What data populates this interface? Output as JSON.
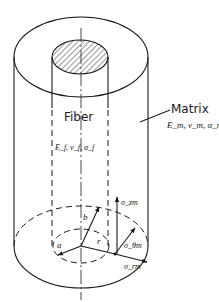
{
  "diagram": {
    "fiber": {
      "label": "Fiber",
      "properties": "E_f,   ν_f, α_f",
      "props_display": [
        "E",
        "f",
        ",",
        "ν",
        "f",
        ", α",
        "f"
      ]
    },
    "matrix": {
      "label": "Matrix",
      "properties": "E_m, ν_m, α_m"
    },
    "dimensions": {
      "inner_radius": "a",
      "outer_radius": "b",
      "radial_coordinate": "r"
    },
    "stresses": {
      "axial": "σ_zm",
      "hoop": "σ_θm",
      "radial": "σ_rm"
    },
    "colors": {
      "stroke": "#1a1a1a",
      "background": "#ffffff"
    }
  }
}
